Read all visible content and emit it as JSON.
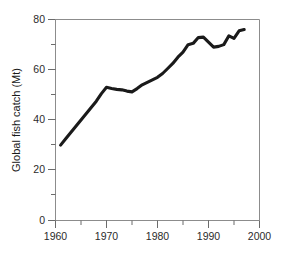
{
  "chart_data": {
    "type": "line",
    "title": "",
    "subtitle": "",
    "xlabel": "",
    "ylabel": "Global fish catch (Mt)",
    "xlim": [
      1960,
      2000
    ],
    "ylim": [
      0,
      80
    ],
    "grid": false,
    "legend": null,
    "legend_position": "none",
    "x_ticks_major": [
      1960,
      1970,
      1980,
      1990,
      2000
    ],
    "x_tick_labels": [
      "1960",
      "1970",
      "1980",
      "1990",
      "2000"
    ],
    "x_ticks_minor": [
      1965,
      1975,
      1985,
      1995
    ],
    "y_ticks_major": [
      0,
      20,
      40,
      60,
      80
    ],
    "y_tick_labels": [
      "0",
      "20",
      "40",
      "60",
      "80"
    ],
    "y_ticks_minor": [
      10,
      30,
      50,
      70
    ],
    "line_color": "#1a1a1a",
    "frame_color": "#8c8c8c",
    "series": [
      {
        "name": "Global fish catch",
        "units": "Mt",
        "x": [
          1961,
          1962,
          1963,
          1964,
          1965,
          1966,
          1967,
          1968,
          1969,
          1970,
          1971,
          1972,
          1973,
          1974,
          1975,
          1976,
          1977,
          1978,
          1979,
          1980,
          1981,
          1982,
          1983,
          1984,
          1985,
          1986,
          1987,
          1988,
          1989,
          1990,
          1991,
          1992,
          1993,
          1994,
          1995,
          1996,
          1997
        ],
        "values": [
          30.0,
          32.5,
          35.0,
          37.5,
          40.0,
          42.5,
          45.0,
          47.5,
          50.5,
          53.0,
          52.5,
          52.2,
          52.0,
          51.5,
          51.2,
          52.5,
          54.0,
          55.0,
          56.0,
          57.0,
          58.5,
          60.5,
          62.5,
          65.0,
          67.0,
          70.0,
          70.5,
          72.8,
          73.0,
          71.0,
          69.0,
          69.3,
          70.0,
          73.5,
          72.5,
          75.5,
          76.0
        ]
      }
    ]
  }
}
